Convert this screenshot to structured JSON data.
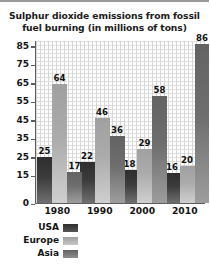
{
  "chart_data": {
    "type": "bar",
    "title": "Sulphur dioxide emissions from fossil fuel burning (in millions of tons)",
    "title_lines": [
      "Sulphur dioxide emissions from fossil",
      "fuel burning (in millions of tons)"
    ],
    "xlabel": "",
    "ylabel": "",
    "categories": [
      "1980",
      "1990",
      "2000",
      "2010"
    ],
    "series": [
      {
        "name": "USA",
        "values": [
          25,
          22,
          18,
          16
        ],
        "color": "#3c3c3c"
      },
      {
        "name": "Europe",
        "values": [
          64,
          46,
          29,
          20
        ],
        "color": "#ababab"
      },
      {
        "name": "Asia",
        "values": [
          17,
          36,
          58,
          86
        ],
        "color": "#6e6e6e"
      }
    ],
    "ylim": [
      0,
      88
    ],
    "yticks": [
      0,
      15,
      25,
      35,
      45,
      55,
      65,
      75,
      85
    ],
    "ytick_labels": [
      "0",
      "15",
      "25",
      "35",
      "45",
      "55",
      "65",
      "75",
      "85"
    ],
    "grid": true,
    "legend_position": "bottom-left",
    "data_labels": true
  },
  "legend": {
    "items": [
      {
        "label": "USA",
        "series": "usa"
      },
      {
        "label": "Europe",
        "series": "europe"
      },
      {
        "label": "Asia",
        "series": "asia"
      }
    ]
  }
}
